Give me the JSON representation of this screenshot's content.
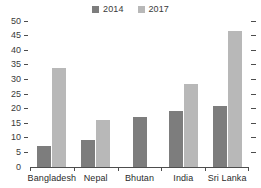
{
  "chart_data": {
    "type": "bar",
    "title": "",
    "subtitle": "",
    "xlabel": "",
    "ylabel": "",
    "categories": [
      "Bangladesh",
      "Nepal",
      "Bhutan",
      "India",
      "Sri Lanka"
    ],
    "series": [
      {
        "name": "2014",
        "color": "#7d7d7d",
        "values": [
          7.2,
          9.3,
          17.0,
          19.2,
          20.8
        ]
      },
      {
        "name": "2017",
        "color": "#b8b8b8",
        "values": [
          34.0,
          16.2,
          null,
          28.5,
          46.5
        ]
      }
    ],
    "ylim": [
      0,
      50
    ],
    "yticks": [
      0,
      5,
      10,
      15,
      20,
      25,
      30,
      35,
      40,
      45,
      50
    ],
    "ytick_labels": [
      "0",
      "5",
      "10",
      "15",
      "20",
      "25",
      "30",
      "35",
      "40",
      "45",
      "50"
    ],
    "grid": false,
    "legend_position": "top-center",
    "legend_entries": [
      "2014",
      "2017"
    ],
    "axis_color": "#4d4d4d",
    "background_color": "#ffffff",
    "right_axis_ticks": true
  }
}
